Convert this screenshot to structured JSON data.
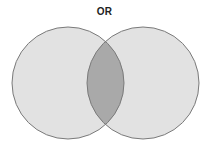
{
  "diagram": {
    "title": "OR",
    "type": "venn",
    "sets": [
      {
        "id": "left",
        "cx": 68,
        "cy": 83,
        "r": 56
      },
      {
        "id": "right",
        "cx": 143,
        "cy": 83,
        "r": 56
      }
    ],
    "colors": {
      "fill": "#e2e2e2",
      "intersection": "#a9a9a9",
      "stroke": "#7a7a7a"
    }
  }
}
